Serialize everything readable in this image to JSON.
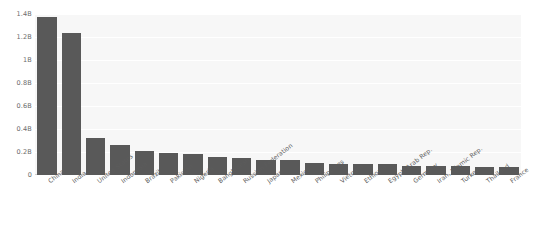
{
  "chart_data": {
    "type": "bar",
    "title": "",
    "subtitle": "",
    "xlabel": "",
    "ylabel": "",
    "ylim": [
      0,
      1400000000
    ],
    "grid": true,
    "legend": false,
    "legend_position": "none",
    "bar_color": "#595959",
    "plot_background": "#f7f7f7",
    "axis_color": "#cfcfcf",
    "tick_label_color": "#6b6b6b",
    "y_ticks": [
      {
        "label": "0",
        "value": 0
      },
      {
        "label": "0.2B",
        "value": 200000000
      },
      {
        "label": "0.4B",
        "value": 400000000
      },
      {
        "label": "0.6B",
        "value": 600000000
      },
      {
        "label": "0.8B",
        "value": 800000000
      },
      {
        "label": "1B",
        "value": 1000000000
      },
      {
        "label": "1.2B",
        "value": 1200000000
      },
      {
        "label": "1.4B",
        "value": 1400000000
      }
    ],
    "categories": [
      "China",
      "India",
      "United States",
      "Indonesia",
      "Brazil",
      "Pakistan",
      "Nigeria",
      "Bangladesh",
      "Russian Federation",
      "Japan",
      "Mexico",
      "Philippines",
      "Vietnam",
      "Ethiopia",
      "Egypt, Arab Rep.",
      "Germany",
      "Iran, Islamic Rep.",
      "Turkey",
      "Thailand",
      "France"
    ],
    "values": [
      1371000000,
      1237000000,
      321000000,
      258000000,
      208000000,
      189000000,
      182000000,
      161000000,
      144000000,
      127000000,
      127000000,
      101000000,
      92000000,
      99000000,
      92000000,
      81000000,
      79000000,
      78000000,
      68000000,
      67000000
    ]
  }
}
